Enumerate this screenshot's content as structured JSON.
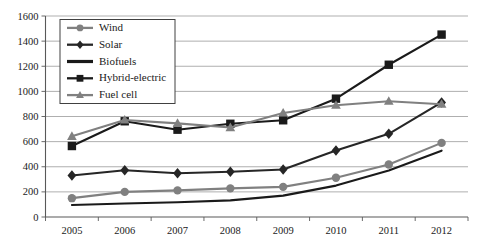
{
  "chart_data": {
    "type": "line",
    "title": "",
    "xlabel": "",
    "ylabel": "",
    "categories": [
      "2005",
      "2006",
      "2007",
      "2008",
      "2009",
      "2010",
      "2011",
      "2012"
    ],
    "ylim": [
      0,
      1600
    ],
    "ytick_values": [
      0,
      200,
      400,
      600,
      800,
      1000,
      1200,
      1400,
      1600
    ],
    "ytick_labels": [
      "0",
      "200",
      "400",
      "600",
      "800",
      "1000",
      "1200",
      "1400",
      "1600"
    ],
    "grid": "horizontal",
    "legend_position": "top-left-inside",
    "series": [
      {
        "name": "Wind",
        "marker": "circle",
        "color": "#808080",
        "values": [
          150,
          200,
          212,
          228,
          240,
          312,
          418,
          590
        ]
      },
      {
        "name": "Solar",
        "marker": "diamond",
        "color": "#262626",
        "values": [
          330,
          372,
          348,
          360,
          378,
          530,
          662,
          912
        ]
      },
      {
        "name": "Biofuels",
        "marker": "none",
        "color": "#1a1a1a",
        "values": [
          95,
          108,
          118,
          132,
          170,
          250,
          370,
          528
        ]
      },
      {
        "name": "Hybrid-electric",
        "marker": "square",
        "color": "#1a1a1a",
        "values": [
          565,
          762,
          695,
          742,
          770,
          942,
          1212,
          1452
        ]
      },
      {
        "name": "Fuel cell",
        "marker": "triangle",
        "color": "#808080",
        "values": [
          642,
          772,
          745,
          712,
          828,
          890,
          922,
          898
        ]
      }
    ]
  },
  "axes": {
    "frame_color": "#595959",
    "grid_color": "#a6a6a6"
  },
  "legend": {
    "items": [
      {
        "label": "Wind"
      },
      {
        "label": "Solar"
      },
      {
        "label": "Biofuels"
      },
      {
        "label": "Hybrid-electric"
      },
      {
        "label": "Fuel cell"
      }
    ]
  }
}
